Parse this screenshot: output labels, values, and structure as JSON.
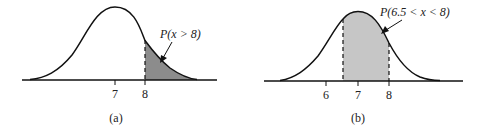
{
  "panels": [
    {
      "id": "a",
      "caption": "(a)",
      "annotation": "P(x > 8)",
      "ticks": [
        {
          "value": "7",
          "x": 115
        },
        {
          "value": "8",
          "x": 145
        }
      ],
      "shade": {
        "from": 8,
        "to": "inf",
        "color": "#8c8c8c"
      },
      "mean": 7
    },
    {
      "id": "b",
      "caption": "(b)",
      "annotation": "P(6.5 < x < 8)",
      "ticks": [
        {
          "value": "6",
          "x": 326
        },
        {
          "value": "7",
          "x": 358
        },
        {
          "value": "8",
          "x": 389
        }
      ],
      "shade": {
        "from": 6.5,
        "to": 8,
        "color": "#c6c6c6"
      },
      "mean": 7
    }
  ],
  "colors": {
    "line": "#111111",
    "shade_dark": "#8c8c8c",
    "shade_light": "#c6c6c6"
  }
}
